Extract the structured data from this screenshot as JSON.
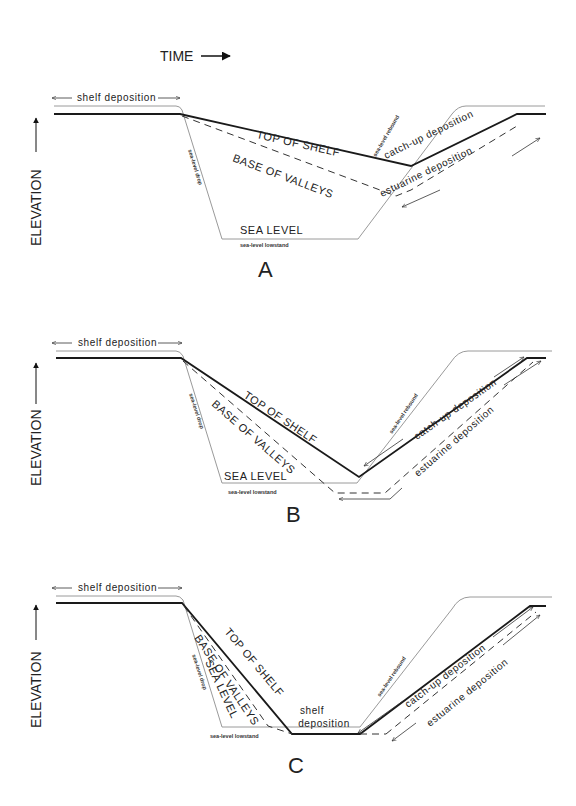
{
  "header": {
    "time_label": "TIME"
  },
  "axis": {
    "y_label": "ELEVATION"
  },
  "panels": [
    {
      "id": "A",
      "letter": "A",
      "labels": {
        "shelf_deposition": "shelf deposition",
        "top_of_shelf": "TOP OF SHELF",
        "base_of_valleys": "BASE OF VALLEYS",
        "sea_level": "SEA LEVEL",
        "sea_level_lowstand": "sea-level lowstand",
        "sea_level_drop": "sea-level drop",
        "sea_level_rebound": "sea-level rebound",
        "catch_up_deposition": "catch-up deposition",
        "estuarine_deposition": "estuarine deposition"
      }
    },
    {
      "id": "B",
      "letter": "B",
      "labels": {
        "shelf_deposition": "shelf deposition",
        "top_of_shelf": "TOP OF SHELF",
        "base_of_valleys": "BASE OF VALLEYS",
        "sea_level": "SEA LEVEL",
        "sea_level_lowstand": "sea-level lowstand",
        "sea_level_drop": "sea-level drop",
        "sea_level_rebound": "sea-level rebound",
        "catch_up_deposition": "catch-up deposition",
        "estuarine_deposition": "estuarine deposition"
      }
    },
    {
      "id": "C",
      "letter": "C",
      "labels": {
        "shelf_deposition": "shelf deposition",
        "top_of_shelf": "TOP OF SHELF",
        "base_of_valleys": "BASE OF VALLEYS",
        "sea_level": "SEA LEVEL",
        "sea_level_lowstand": "sea-level lowstand",
        "sea_level_drop": "sea-level drop",
        "sea_level_rebound": "sea-level rebound",
        "catch_up_deposition": "catch-up deposition",
        "estuarine_deposition": "estuarine deposition",
        "shelf_deposition_lower_1": "shelf",
        "shelf_deposition_lower_2": "deposition"
      }
    }
  ]
}
